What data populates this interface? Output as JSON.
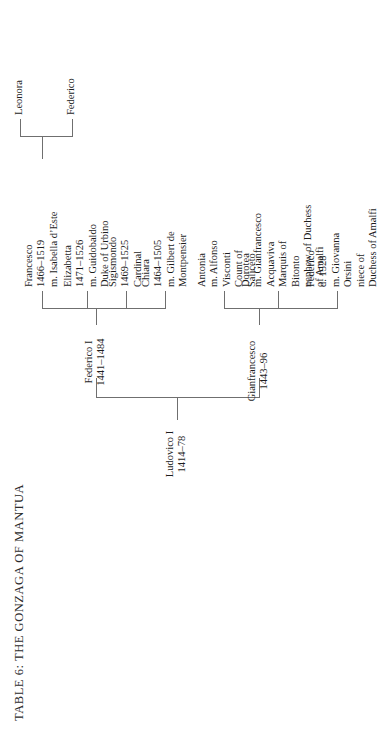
{
  "title": "TABLE 6: THE GONZAGA OF MANTUA",
  "diagram": {
    "type": "family-tree",
    "orientation": "rotated-90-ccw",
    "nodes": {
      "ludovico": {
        "name": "Ludovico I",
        "dates": "1414–78",
        "lines": [
          "Ludovico I",
          "1414–78"
        ]
      },
      "gianfrancesco": {
        "name": "Gianfrancesco",
        "dates": "1443–96",
        "lines": [
          "Gianfrancesco",
          "1443–96"
        ]
      },
      "federico_i": {
        "name": "Federico I",
        "dates": "1441–1484",
        "lines": [
          "Federico I",
          "1441–1484"
        ]
      },
      "federico_d1528": {
        "name": "Federico",
        "dates": "d. 1528",
        "lines": [
          "Federico",
          "d. 1528",
          "m. Giovanna",
          "Orsini",
          "niece of",
          "Duchess of Amalfi"
        ]
      },
      "dorotea": {
        "name": "Dorotea",
        "lines": [
          "Dorotea",
          "m. Gianfrancesco",
          "Acquaviva",
          "Marquis of",
          "Bitonto",
          "nephew of Duchess",
          "of Amalfi"
        ]
      },
      "antonia": {
        "name": "Antonia",
        "lines": [
          "Antonia",
          "m. Alfonso",
          "Visconti",
          "Count of",
          "Saliceto"
        ]
      },
      "chiara": {
        "name": "Chiara",
        "dates": "1464–1505",
        "lines": [
          "Chiara",
          "1464–1505",
          "m. Gilbert de",
          "Montpensier"
        ]
      },
      "sigismondo": {
        "name": "Sigismondo",
        "dates": "1469–1525",
        "lines": [
          "Sigismondo",
          "1469–1525",
          "Cardinal"
        ]
      },
      "elizabetta": {
        "name": "Elizabetta",
        "dates": "1471–1526",
        "lines": [
          "Elizabetta",
          "1471–1526",
          "m. Guidobaldo",
          "Duke of Urbino"
        ]
      },
      "francesco": {
        "name": "Francesco",
        "dates": "1466–1519",
        "lines": [
          "Francesco",
          "1466–1519",
          "m. Isabella d’Este"
        ]
      },
      "federico_son": {
        "name": "Federico",
        "lines": [
          "Federico"
        ]
      },
      "leonora": {
        "name": "Leonora",
        "lines": [
          "Leonora"
        ]
      }
    }
  }
}
